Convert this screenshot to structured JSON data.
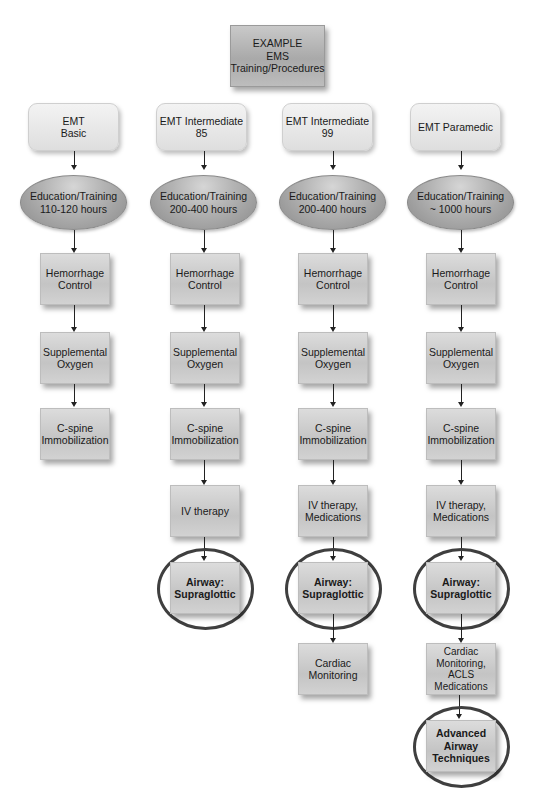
{
  "root": {
    "label": "EXAMPLE\nEMS\nTraining/Procedures"
  },
  "columns": [
    {
      "level": "EMT\nBasic",
      "education": "Education/Training\n110-120 hours",
      "steps": [
        {
          "label": "Hemorrhage\nControl",
          "highlighted": false
        },
        {
          "label": "Supplemental\nOxygen",
          "highlighted": false
        },
        {
          "label": "C-spine\nImmobilization",
          "highlighted": false
        }
      ]
    },
    {
      "level": "EMT Intermediate\n85",
      "education": "Education/Training\n200-400 hours",
      "steps": [
        {
          "label": "Hemorrhage\nControl",
          "highlighted": false
        },
        {
          "label": "Supplemental\nOxygen",
          "highlighted": false
        },
        {
          "label": "C-spine\nImmobilization",
          "highlighted": false
        },
        {
          "label": "IV therapy",
          "highlighted": false
        },
        {
          "label": "Airway:\nSupraglottic",
          "highlighted": true
        }
      ]
    },
    {
      "level": "EMT Intermediate\n99",
      "education": "Education/Training\n200-400 hours",
      "steps": [
        {
          "label": "Hemorrhage\nControl",
          "highlighted": false
        },
        {
          "label": "Supplemental\nOxygen",
          "highlighted": false
        },
        {
          "label": "C-spine\nImmobilization",
          "highlighted": false
        },
        {
          "label": "IV therapy,\nMedications",
          "highlighted": false
        },
        {
          "label": "Airway:\nSupraglottic",
          "highlighted": true
        },
        {
          "label": "Cardiac\nMonitoring",
          "highlighted": false
        }
      ]
    },
    {
      "level": "EMT Paramedic",
      "education": "Education/Training\n~ 1000 hours",
      "steps": [
        {
          "label": "Hemorrhage\nControl",
          "highlighted": false
        },
        {
          "label": "Supplemental\nOxygen",
          "highlighted": false
        },
        {
          "label": "C-spine\nImmobilization",
          "highlighted": false
        },
        {
          "label": "IV therapy,\nMedications",
          "highlighted": false
        },
        {
          "label": "Airway:\nSupraglottic",
          "highlighted": true
        },
        {
          "label": "Cardiac\nMonitoring,\nACLS\nMedications",
          "highlighted": false
        },
        {
          "label": "Advanced\nAirway\nTechniques",
          "highlighted": true
        }
      ]
    }
  ],
  "colors": {
    "ring": "#3f3f3f",
    "connector": "#222222"
  }
}
